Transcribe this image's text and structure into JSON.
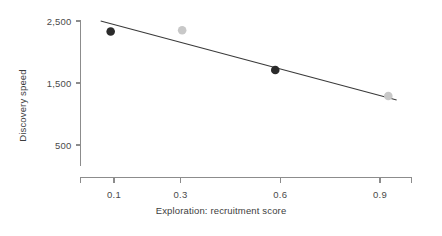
{
  "chart_data": {
    "type": "scatter",
    "title": "",
    "subtitle": "",
    "xlabel": "Exploration: recruitment score",
    "ylabel": "Discovery speed",
    "xlim": [
      0.0,
      1.0
    ],
    "ylim": [
      0,
      2500
    ],
    "grid": false,
    "legend": "none",
    "xticks": [
      "0.1",
      "0.3",
      "0.6",
      "0.9"
    ],
    "xtick_values": [
      0.1,
      0.3,
      0.6,
      0.9
    ],
    "yticks": [
      "2,500",
      "1,500",
      "500"
    ],
    "ytick_values": [
      2500,
      1500,
      500
    ],
    "points": [
      {
        "label": "point-1",
        "x": 0.09,
        "y": 2330,
        "color": "#2b2b2b",
        "group": "dark"
      },
      {
        "label": "point-2",
        "x": 0.305,
        "y": 2350,
        "color": "#c8c8c8",
        "group": "light"
      },
      {
        "label": "point-3",
        "x": 0.585,
        "y": 1710,
        "color": "#2b2b2b",
        "group": "dark"
      },
      {
        "label": "point-4",
        "x": 0.925,
        "y": 1290,
        "color": "#c8c8c8",
        "group": "light"
      }
    ],
    "trendline": {
      "label": "fit-line",
      "x0": 0.06,
      "y0": 2500,
      "x1": 0.95,
      "y1": 1225,
      "color": "#3a3a3a"
    },
    "colors": {
      "dark_marker": "#2b2b2b",
      "light_marker": "#c8c8c8",
      "axis": "#8c8c8c",
      "trendline": "#3a3a3a",
      "tick_text": "#4a4a4a",
      "background": "#ffffff"
    }
  }
}
